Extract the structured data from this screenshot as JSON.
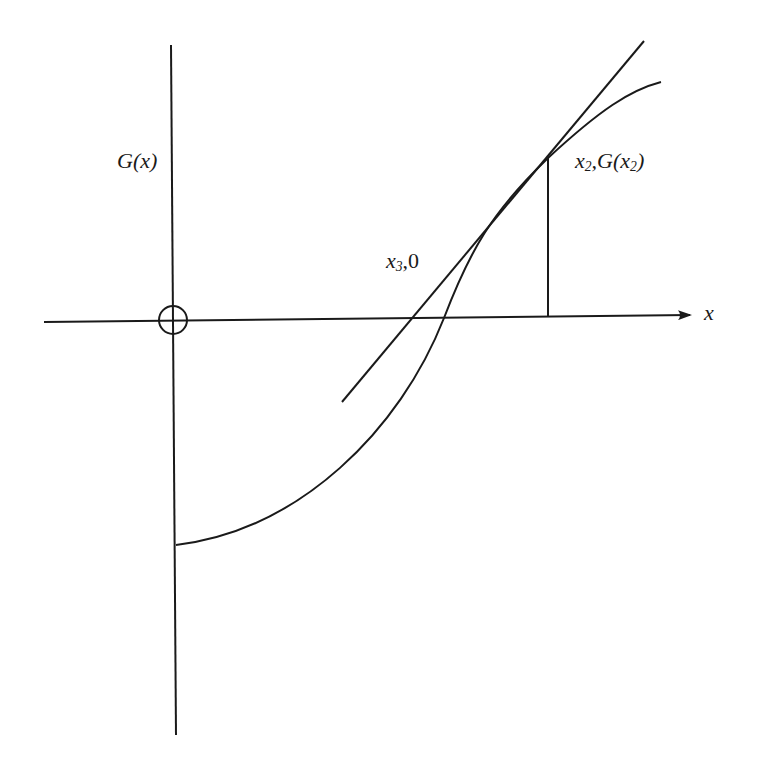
{
  "diagram": {
    "colors": {
      "ink": "#1a1a1a",
      "background": "#ffffff"
    },
    "labels": {
      "y_axis": "G(x)",
      "x_axis": "x",
      "point_x3": {
        "var": "x",
        "sub": "3",
        "rest": ",0"
      },
      "point_x2": {
        "var": "x",
        "sub": "2",
        "mid": ",G(x",
        "sub2": "2",
        "end": ")"
      }
    },
    "elements": {
      "x_axis": {
        "from": [
          44,
          322
        ],
        "to": [
          690,
          315
        ],
        "arrow": true
      },
      "y_axis": {
        "from": [
          171,
          45
        ],
        "to": [
          176,
          735
        ]
      },
      "origin_circle": {
        "center": [
          173,
          320
        ],
        "r": 14
      },
      "curve_G": "M 176 545 C 300 530, 400 430, 444 318 C 470 250, 490 215, 548 158 C 600 110, 630 90, 661 82",
      "tangent_line": {
        "from": [
          342,
          402
        ],
        "to": [
          644,
          41
        ]
      },
      "vertical_x2": {
        "from": [
          548,
          158
        ],
        "to": [
          548,
          316
        ]
      }
    }
  }
}
